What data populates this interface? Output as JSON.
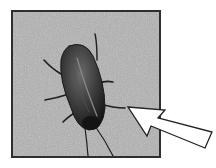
{
  "image": {
    "description": "Grayscale photograph of a cockroach on a speckled surface, framed with a dark border; a white outlined arrow points to the insect's head.",
    "subject": "cockroach",
    "annotation": "arrow pointing at cockroach",
    "colors": {
      "background": "#a9a9a9",
      "frame_border": "#2e2e2e",
      "insect_body": "#2a2a2a",
      "arrow_fill": "#ffffff",
      "arrow_stroke": "#222222"
    }
  }
}
